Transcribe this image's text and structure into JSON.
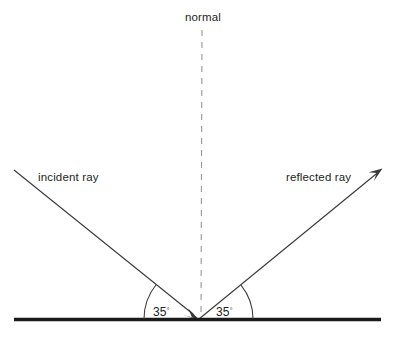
{
  "diagram": {
    "type": "physics-reflection-diagram",
    "background_color": "#ffffff",
    "canvas": {
      "width": 397,
      "height": 337
    },
    "labels": {
      "normal": "normal",
      "incident_ray": "incident ray",
      "reflected_ray": "reflected ray",
      "angle_of_incidence": "35",
      "angle_of_reflection": "35",
      "degree_symbol": "°"
    },
    "colors": {
      "ray_stroke": "#3b3b3b",
      "normal_stroke": "#9a9a9a",
      "surface_stroke": "#1a1a1a",
      "text": "#231f20",
      "arc_stroke": "#3b3b3b"
    },
    "geometry": {
      "point_of_incidence": {
        "x": 199,
        "y": 319
      },
      "surface": {
        "x1": 14,
        "y1": 319.5,
        "x2": 381,
        "y2": 319.5
      },
      "normal": {
        "x1": 202,
        "y1": 30,
        "x2": 201,
        "y2": 317
      },
      "incident_ray": {
        "x1": 14,
        "y1": 170,
        "x2": 199,
        "y2": 319
      },
      "reflected_ray": {
        "x1": 199,
        "y1": 319,
        "x2": 382,
        "y2": 169
      },
      "left_arc": {
        "cx": 199,
        "cy": 319,
        "radius": 55,
        "start_deg": 180,
        "end_deg": 141
      },
      "right_arc": {
        "cx": 199,
        "cy": 319,
        "radius": 54,
        "start_deg": 0,
        "end_deg": 39
      }
    },
    "label_positions": {
      "normal": {
        "x": 203,
        "y": 21,
        "anchor": "middle"
      },
      "incident_ray": {
        "x": 38,
        "y": 181,
        "anchor": "start"
      },
      "reflected_ray": {
        "x": 286,
        "y": 181,
        "anchor": "start"
      },
      "angle_left": {
        "x": 153,
        "y": 316,
        "anchor": "start"
      },
      "angle_right": {
        "x": 216,
        "y": 316,
        "anchor": "start"
      }
    }
  }
}
